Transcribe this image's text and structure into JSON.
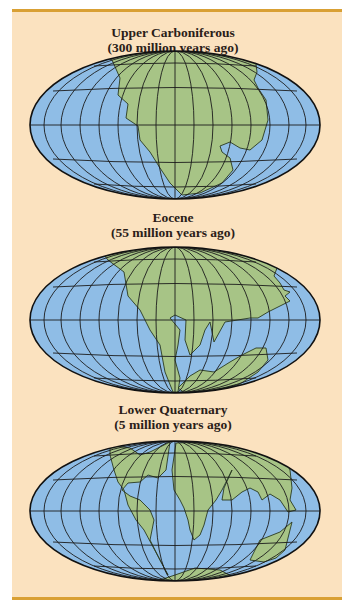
{
  "figure": {
    "colors": {
      "panel_background": "#fbe2bf",
      "panel_rule": "#d9a034",
      "ocean": "#8fbde6",
      "land": "#a7c486",
      "grid": "#1c1c1c"
    },
    "maps": [
      {
        "id": "upper-carboniferous",
        "title": "Upper Carboniferous",
        "subtitle": "(300 million years ago)"
      },
      {
        "id": "eocene",
        "title": "Eocene",
        "subtitle": "(55 million years ago)"
      },
      {
        "id": "lower-quaternary",
        "title": "Lower Quaternary",
        "subtitle": "(5 million years ago)"
      }
    ]
  }
}
